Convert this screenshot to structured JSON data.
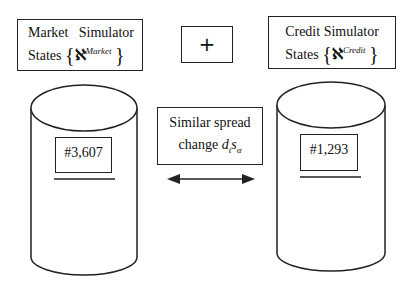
{
  "market_box": {
    "word1": "Market",
    "word2": "Simulator",
    "states_label": "States",
    "open_brace": "{",
    "aleph": "ℵ",
    "superscript": "Market",
    "close_brace": "}"
  },
  "plus_box": {
    "symbol": "+"
  },
  "credit_box": {
    "line1": "Credit Simulator",
    "states_label": "States",
    "open_brace": "{",
    "aleph": "ℵ",
    "superscript": "Credit",
    "close_brace": "}"
  },
  "spread_box": {
    "line1": "Similar spread",
    "change_label": "change",
    "d": "d",
    "d_sub": "t",
    "s": "s",
    "s_sub": "α"
  },
  "market_db": {
    "count": "#3,607"
  },
  "credit_db": {
    "count": "#1,293"
  },
  "arrow": {
    "type": "double-headed",
    "icon": "double-arrow-icon"
  }
}
